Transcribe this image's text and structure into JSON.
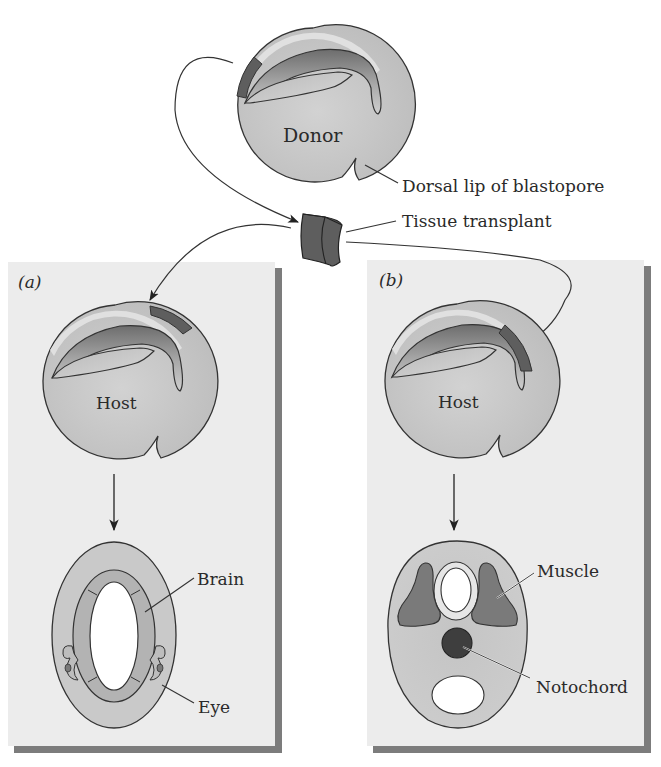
{
  "figure": {
    "colors": {
      "background": "#ffffff",
      "panel": "#ececec",
      "panel_shadow": "#7c7c7c",
      "embryo_fill": "#c9c9c9",
      "embryo_light": "#e2e2e2",
      "tissue_dark": "#5e5e5e",
      "outline": "#333333",
      "hole": "#ffffff",
      "notochord": "#3e3e3e",
      "muscle": "#7a7a7a",
      "brain": "#b3b3b3"
    },
    "donor": {
      "label": "Donor",
      "callout": "Dorsal lip of blastopore"
    },
    "transplant": {
      "label": "Tissue transplant"
    },
    "panel_a": {
      "tag": "(a)",
      "host_label": "Host",
      "labels": {
        "brain": "Brain",
        "eye": "Eye"
      }
    },
    "panel_b": {
      "tag": "(b)",
      "host_label": "Host",
      "labels": {
        "muscle": "Muscle",
        "notochord": "Notochord"
      }
    }
  }
}
